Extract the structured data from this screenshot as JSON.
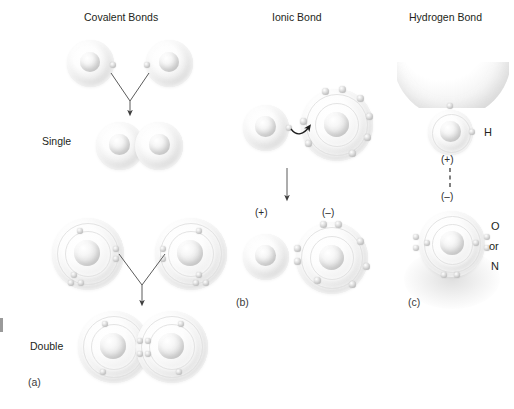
{
  "figure": {
    "panels": [
      {
        "id": "a",
        "letter": "(a)",
        "title": "Covalent Bonds",
        "rows": [
          {
            "label": "Single",
            "description": "Two hydrogen atoms each share one electron forming a single covalent bond"
          },
          {
            "label": "Double",
            "description": "Two oxygen atoms each share two electrons forming a double covalent bond"
          }
        ]
      },
      {
        "id": "b",
        "letter": "(b)",
        "title": "Ionic Bond",
        "charges": {
          "positive": "(+)",
          "negative": "(–)"
        },
        "description": "An electron is transferred from the small atom to the large atom producing a positive ion and a negative ion"
      },
      {
        "id": "c",
        "letter": "(c)",
        "title": "Hydrogen Bond",
        "charges": {
          "positive": "(+)",
          "negative": "(–)"
        },
        "atom_labels": {
          "hydrogen": "H",
          "conjunction": "or",
          "acceptor_primary": "O",
          "acceptor_secondary": "N"
        },
        "description": "A partially positive hydrogen is weakly attracted to a partially negative oxygen or nitrogen"
      }
    ],
    "colors": {
      "text": "#231f20",
      "atom_fill": "#f2f2f2",
      "electron": "#bdbdbd",
      "arrow": "#4a4a4a",
      "shell_ring": "#e2e2e2"
    }
  }
}
